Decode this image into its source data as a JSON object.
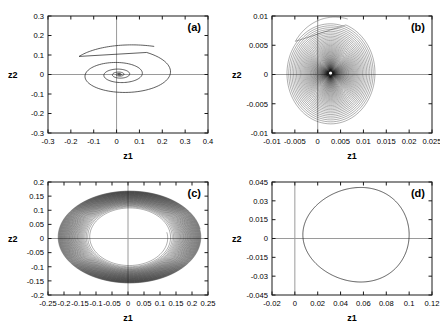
{
  "figure": {
    "background": "#ffffff",
    "axis_color": "#1a1a1a",
    "zeroline_color": "#9a9a9a",
    "curve_color": "#1a1a1a",
    "panel_count": 4
  },
  "chart_data": [
    {
      "type": "line",
      "panel_label": "(a)",
      "title": "",
      "xlabel": "z1",
      "ylabel": "z2",
      "xlim": [
        -0.3,
        0.4
      ],
      "ylim": [
        -0.3,
        0.3
      ],
      "xticks": [
        -0.3,
        -0.2,
        -0.1,
        0,
        0.1,
        0.2,
        0.3,
        0.4
      ],
      "xticklabels": [
        "-0.3",
        "-0.2",
        "-0.1",
        "0",
        "0.1",
        "0.2",
        "0.3",
        "0.4"
      ],
      "yticks": [
        -0.3,
        -0.2,
        -0.1,
        0,
        0.1,
        0.2,
        0.3
      ],
      "yticklabels": [
        "-0.3",
        "-0.2",
        "-0.1",
        "0",
        "0.1",
        "0.2",
        "0.3"
      ],
      "grid": false,
      "legend": null,
      "description": "Inward decaying spiral converging to a stable focus at the origin",
      "spiral": {
        "kind": "inward",
        "center": [
          0.012,
          0.0
        ],
        "start_angle_deg": 62,
        "turns": 5.2,
        "r0_x": 0.255,
        "r0_y": 0.128,
        "r_end_x": 0.004,
        "r_end_y": 0.002,
        "decay": 0.555,
        "hook": true,
        "hook_extent": 0.07,
        "aspect_ratio": 0.52
      }
    },
    {
      "type": "line",
      "panel_label": "(b)",
      "title": "",
      "xlabel": "z1",
      "ylabel": "z2",
      "xlim": [
        -0.01,
        0.025
      ],
      "ylim": [
        -0.01,
        0.01
      ],
      "xticks": [
        -0.01,
        -0.005,
        0,
        0.005,
        0.01,
        0.015,
        0.02,
        0.025
      ],
      "xticklabels": [
        "-0.01",
        "-0.005",
        "0",
        "0.005",
        "0.01",
        "0.015",
        "0.02",
        "0.025"
      ],
      "yticks": [
        -0.01,
        -0.005,
        0,
        0.005,
        0.01
      ],
      "yticklabels": [
        "-0.01",
        "-0.005",
        "0",
        "0.005",
        "0.01"
      ],
      "grid": false,
      "legend": null,
      "description": "Very dense slowly-decaying spiral filling a disc, darkest at the core near the origin",
      "spiral": {
        "kind": "inward-dense",
        "center": [
          0.0028,
          0.0002
        ],
        "start_angle_deg": 70,
        "turns": 78,
        "r0_x": 0.0098,
        "r0_y": 0.0088,
        "r_end_x": 0.0004,
        "r_end_y": 0.00035,
        "decay": 0.96,
        "hook": true,
        "hook_extent": 0.0012,
        "aspect_ratio": 0.9
      }
    },
    {
      "type": "line",
      "panel_label": "(c)",
      "title": "",
      "xlabel": "z1",
      "ylabel": "z2",
      "xlim": [
        -0.25,
        0.25
      ],
      "ylim": [
        -0.2,
        0.2
      ],
      "xticks": [
        -0.25,
        -0.2,
        -0.15,
        -0.1,
        -0.05,
        0,
        0.05,
        0.1,
        0.15,
        0.2,
        0.25
      ],
      "xticklabels": [
        "-0.25",
        "-0.2",
        "-0.15",
        "-0.1",
        "-0.05",
        "0",
        "0.05",
        "0.1",
        "0.15",
        "0.2",
        "0.25"
      ],
      "yticks": [
        -0.2,
        -0.15,
        -0.1,
        -0.05,
        0,
        0.05,
        0.1,
        0.15,
        0.2
      ],
      "yticklabels": [
        "-0.2",
        "-0.15",
        "-0.1",
        "-0.05",
        "0",
        "0.05",
        "0.1",
        "0.15",
        "0.2"
      ],
      "grid": false,
      "legend": null,
      "description": "Outward growing spiral forming a dense annulus that converges onto an outer limit cycle, interior empty",
      "spiral": {
        "kind": "outward-annulus",
        "center": [
          0.005,
          0.005
        ],
        "start_angle_deg": 10,
        "turns": 46,
        "r0_x": 0.118,
        "r0_y": 0.098,
        "r_end_x": 0.224,
        "r_end_y": 0.163,
        "decay": 1.0,
        "hook": false,
        "hook_extent": 0,
        "aspect_ratio": 0.73
      }
    },
    {
      "type": "line",
      "panel_label": "(d)",
      "title": "",
      "xlabel": "z1",
      "ylabel": "z2",
      "xlim": [
        -0.02,
        0.12
      ],
      "ylim": [
        -0.045,
        0.045
      ],
      "xticks": [
        -0.02,
        0,
        0.02,
        0.04,
        0.06,
        0.08,
        0.1,
        0.12
      ],
      "xticklabels": [
        "-0.02",
        "0",
        "0.02",
        "0.04",
        "0.06",
        "0.08",
        "0.1",
        "0.12"
      ],
      "yticks": [
        -0.045,
        -0.03,
        -0.015,
        0,
        0.015,
        0.03,
        0.045
      ],
      "yticklabels": [
        "-0.045",
        "-0.03",
        "-0.015",
        "0",
        "0.015",
        "0.03",
        "0.045"
      ],
      "grid": false,
      "legend": null,
      "description": "Single closed periodic orbit (limit cycle), slightly egg-shaped, offset to the right of the z2 axis",
      "orbit": {
        "kind": "closed-limit-cycle",
        "center": [
          0.0535,
          0.003
        ],
        "rx": 0.0465,
        "ry": 0.0375,
        "x_min": 0.007,
        "x_max": 0.1,
        "y_min": -0.0345,
        "y_max": 0.0395,
        "egg_factor": 0.09
      }
    }
  ]
}
